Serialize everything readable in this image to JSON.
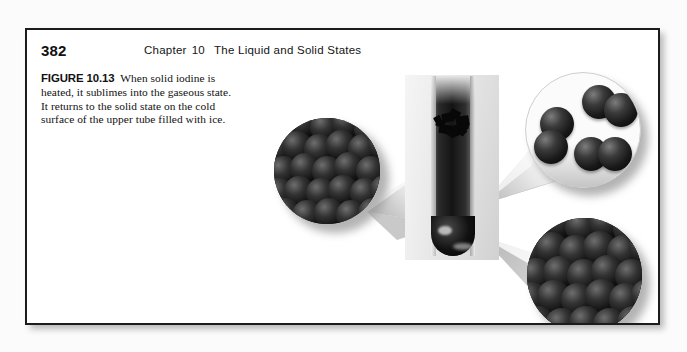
{
  "page": {
    "folio": "382",
    "running_head_chapter": "Chapter",
    "running_head_number": "10",
    "running_head_title": "The Liquid and Solid States",
    "border_color": "#1c1c1c",
    "background_color": "#ffffff"
  },
  "caption": {
    "figure_label": "FIGURE 10.13",
    "line1": "When solid iodine is",
    "line2": "heated, it sublimes into the gaseous state.",
    "line3": "It returns to the solid state on the cold",
    "line4": "surface of the upper tube filled with ice.",
    "full_text": "FIGURE 10.13 When solid iodine is heated, it sublimes into the gaseous state. It returns to the solid state on the cold surface of the upper tube filled with ice."
  },
  "artwork": {
    "photo_label": "test-tube-photograph",
    "photo_background_color": "#e4e4e4",
    "tube_label": "test-tube-with-iodine-vapor",
    "vapor_color": "#141414",
    "crystal_label": "resublimed-iodine-crystals",
    "insets": [
      {
        "name": "solid-iodine-lattice-left",
        "state": "solid",
        "description": "close-packed iodine spheres",
        "background_color": "#131313"
      },
      {
        "name": "gaseous-iodine-molecules",
        "state": "gas",
        "description": "three separated diatomic I2 molecules",
        "background_color": "#fbfbfb"
      },
      {
        "name": "solid-iodine-lattice-bottom",
        "state": "solid",
        "description": "close-packed iodine spheres",
        "background_color": "#131313"
      }
    ],
    "connectors": [
      {
        "name": "cone-tube-to-left-inset"
      },
      {
        "name": "cone-crystal-to-gas-inset"
      },
      {
        "name": "cone-tube-to-bottom-inset"
      }
    ]
  }
}
